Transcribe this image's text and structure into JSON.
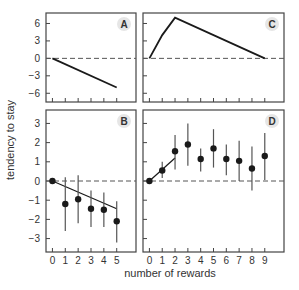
{
  "chart_data": [
    {
      "panel": "A",
      "type": "line",
      "x": [
        0,
        5
      ],
      "series": [
        {
          "name": "model",
          "values": [
            0,
            -5
          ]
        }
      ],
      "ylim": [
        -7.5,
        7.8
      ],
      "yticks": [
        -6,
        -3,
        0,
        3,
        6
      ],
      "xlim": [
        -0.5,
        6.5
      ],
      "xticks": [
        0,
        1,
        2,
        3,
        4,
        5
      ],
      "reference_line": 0,
      "grid": false
    },
    {
      "panel": "C",
      "type": "line",
      "x": [
        0,
        1,
        2,
        9
      ],
      "series": [
        {
          "name": "model",
          "values": [
            0,
            4,
            7,
            0
          ]
        }
      ],
      "ylim": [
        -7.5,
        7.8
      ],
      "yticks": [
        -6,
        -3,
        0,
        3,
        6
      ],
      "xlim": [
        -0.5,
        10.5
      ],
      "xticks": [
        0,
        1,
        2,
        3,
        4,
        5,
        6,
        7,
        8,
        9
      ],
      "reference_line": 0,
      "grid": false
    },
    {
      "panel": "B",
      "type": "scatter",
      "x": [
        0,
        1,
        2,
        3,
        4,
        5
      ],
      "series": [
        {
          "name": "data",
          "values": [
            0,
            -1.2,
            -0.95,
            -1.45,
            -1.5,
            -2.1
          ],
          "err_low": [
            0,
            -2.6,
            -2.2,
            -2.4,
            -2.4,
            -3.2
          ],
          "err_high": [
            0,
            0.2,
            0.3,
            -0.5,
            -0.6,
            -1.05
          ]
        },
        {
          "name": "fit",
          "x": [
            0,
            5
          ],
          "values": [
            0,
            -1.45
          ]
        }
      ],
      "ylim": [
        -3.7,
        3.7
      ],
      "yticks": [
        -3,
        -2,
        -1,
        0,
        1,
        2,
        3
      ],
      "xlim": [
        -0.5,
        6.5
      ],
      "xticks": [
        0,
        1,
        2,
        3,
        4,
        5
      ],
      "reference_line": 0,
      "grid": false
    },
    {
      "panel": "D",
      "type": "scatter",
      "x": [
        0,
        1,
        2,
        3,
        4,
        5,
        6,
        7,
        8,
        9
      ],
      "series": [
        {
          "name": "data",
          "values": [
            0,
            0.55,
            1.55,
            1.9,
            1.15,
            1.7,
            1.15,
            1.05,
            0.65,
            1.3
          ],
          "err_low": [
            0,
            0.15,
            0.6,
            0.8,
            0.5,
            0.7,
            0.3,
            0.0,
            -0.5,
            0.05
          ],
          "err_high": [
            0,
            1.0,
            2.4,
            3.0,
            1.7,
            2.7,
            1.9,
            2.1,
            1.8,
            2.5
          ]
        },
        {
          "name": "fit",
          "x": [
            0,
            2
          ],
          "values": [
            0,
            1.2
          ]
        }
      ],
      "ylim": [
        -3.7,
        3.7
      ],
      "yticks": [
        -3,
        -2,
        -1,
        0,
        1,
        2,
        3
      ],
      "xlim": [
        -0.5,
        10.5
      ],
      "xticks": [
        0,
        1,
        2,
        3,
        4,
        5,
        6,
        7,
        8,
        9
      ],
      "reference_line": 0,
      "grid": false
    }
  ],
  "labels": {
    "ylabel": "tendency to stay",
    "xlabel": "number of rewards",
    "panelA": "A",
    "panelB": "B",
    "panelC": "C",
    "panelD": "D"
  },
  "colors": {
    "axis": "#444444",
    "line": "#1a1a1a",
    "errorbar": "#555555",
    "badge": "#e6e6e6"
  }
}
